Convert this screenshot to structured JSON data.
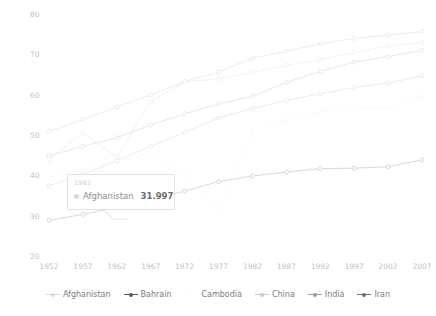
{
  "chart_data": {
    "type": "line",
    "title": "",
    "subtitle": "",
    "xlabel": "",
    "ylabel": "",
    "x": [
      1952,
      1957,
      1962,
      1967,
      1972,
      1977,
      1982,
      1987,
      1992,
      1997,
      2002,
      2007
    ],
    "xtick_labels": [
      "1952",
      "1957",
      "1962",
      "1967",
      "1972",
      "1977",
      "1982",
      "1987",
      "1992",
      "1997",
      "2002",
      "2007"
    ],
    "ytick_labels": [
      "20",
      "30",
      "40",
      "50",
      "60",
      "70",
      "80"
    ],
    "ytick_values": [
      20,
      30,
      40,
      50,
      60,
      70,
      80
    ],
    "ylim": [
      20,
      80
    ],
    "xlim": [
      1952,
      2007
    ],
    "grid": false,
    "legend_position": "bottom",
    "series": [
      {
        "name": "Afghanistan",
        "color": "#d8d8d8",
        "values": [
          28.801,
          30.332,
          31.997,
          34.02,
          36.088,
          38.438,
          39.854,
          40.822,
          41.674,
          41.763,
          42.129,
          43.828
        ]
      },
      {
        "name": "Bahrain",
        "color": "#ededed",
        "values": [
          50.939,
          53.832,
          56.923,
          59.923,
          63.3,
          65.593,
          69.052,
          70.75,
          72.601,
          73.925,
          74.795,
          75.635
        ]
      },
      {
        "name": "Cambodia",
        "color": "#fbfbfb",
        "values": [
          39.417,
          41.366,
          43.415,
          45.415,
          40.317,
          31.22,
          50.957,
          53.914,
          55.803,
          56.534,
          56.752,
          59.723
        ]
      },
      {
        "name": "China",
        "color": "#f2f2f2",
        "values": [
          44.0,
          50.54896,
          44.50136,
          58.38112,
          63.11888,
          63.96736,
          65.525,
          67.274,
          68.69,
          70.426,
          72.028,
          72.961
        ]
      },
      {
        "name": "India",
        "color": "#ececec",
        "values": [
          37.373,
          40.249,
          43.605,
          47.193,
          50.651,
          54.208,
          56.596,
          58.553,
          60.223,
          61.765,
          62.879,
          64.698
        ]
      },
      {
        "name": "Iran",
        "color": "#e8e8e8",
        "values": [
          44.869,
          47.181,
          49.325,
          52.469,
          55.234,
          57.702,
          59.62,
          63.04,
          65.742,
          68.042,
          69.451,
          70.964
        ]
      }
    ]
  },
  "tooltip": {
    "year": "1962",
    "series_name": "Afghanistan",
    "value": "31.997",
    "swatch_color": "#dcdcdc"
  },
  "legend": {
    "items": [
      {
        "label": "Afghanistan",
        "color": "#dadada",
        "marker": "line-dot"
      },
      {
        "label": "Bahrain",
        "color": "#5a5a5a",
        "marker": "line-dot"
      },
      {
        "label": "Cambodia",
        "color": "#fcfcfc",
        "marker": "line-dot"
      },
      {
        "label": "China",
        "color": "#c9c9c9",
        "marker": "line-dot"
      },
      {
        "label": "India",
        "color": "#9e9e9e",
        "marker": "line-dot"
      },
      {
        "label": "Iran",
        "color": "#6f6f6f",
        "marker": "line-dot"
      }
    ]
  }
}
